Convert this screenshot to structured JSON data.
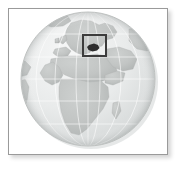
{
  "figure": {
    "kind": "locator-map",
    "projection": "orthographic",
    "style": "grayscale"
  },
  "frame": {
    "border_color": "#9a9a9a",
    "background_color": "#ffffff",
    "shadow_color": "#b4b4b4"
  },
  "globe": {
    "center_x": 85,
    "center_y": 74,
    "radius": 67,
    "ocean_color": "#eef0f0",
    "ocean_shade_color": "#d7dada",
    "land_color": "#c3c6c5",
    "land_edge_color": "#aeb2b1",
    "outline_color": "#b9bcbb",
    "graticule_color": "#ffffff",
    "graticule_meridians": 6,
    "graticule_parallels": 5,
    "highlight_color": "#3a3a3a",
    "shadow_color": "#cfd2d2",
    "visible_region_label": "Europe, Africa and the Middle East"
  },
  "landmasses": [
    {
      "name": "europe",
      "label": "Europe"
    },
    {
      "name": "africa",
      "label": "Africa"
    },
    {
      "name": "middle-east",
      "label": "Middle East / Arabia"
    },
    {
      "name": "greenland-edge",
      "label": "Greenland"
    },
    {
      "name": "south-america-edge",
      "label": "South America"
    },
    {
      "name": "madagascar",
      "label": "Madagascar"
    },
    {
      "name": "british-isles",
      "label": "British Isles"
    }
  ],
  "highlight": {
    "box_label": "highlight box",
    "box_x": 82,
    "box_y": 33,
    "box_width": 23,
    "box_height": 21,
    "box_stroke_color": "#3c3c3c",
    "box_stroke_width": 2,
    "country_label": "Highlighted country",
    "country_fill_color": "#2e2e2e"
  }
}
